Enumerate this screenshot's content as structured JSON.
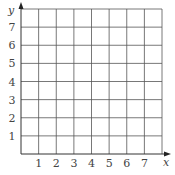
{
  "chart_data": {
    "type": "grid",
    "title": "",
    "xlabel": "x",
    "ylabel": "y",
    "x_ticks": [
      "1",
      "2",
      "3",
      "4",
      "5",
      "6",
      "7"
    ],
    "y_ticks": [
      "1",
      "2",
      "3",
      "4",
      "5",
      "6",
      "7"
    ],
    "xlim": [
      0,
      8
    ],
    "ylim": [
      0,
      8
    ],
    "grid": true,
    "series": []
  },
  "colors": {
    "grid": "#555555",
    "axis": "#333333",
    "text": "#444444"
  }
}
